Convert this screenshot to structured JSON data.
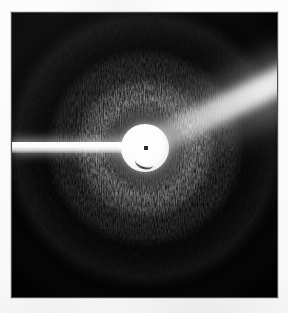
{
  "figure": {
    "title": "X-ray diffraction pattern",
    "kind": "fiber-diffraction-photograph"
  },
  "plate": {
    "label": "detector-image",
    "background_color": "#000000",
    "border_color": "#4a4a4a",
    "paper_color": "#fbfbfa",
    "left": 12,
    "top": 13,
    "width": 265,
    "height": 284
  },
  "beam_center": {
    "label": "beam-center",
    "x_percent": 50.2,
    "y_percent": 47.5,
    "marker_color": "#2c2c2c"
  },
  "beamstop": {
    "label": "beamstop-disc",
    "radius_px": 24,
    "color": "#ffffff"
  },
  "beam_arm": {
    "label": "beamstop-arm-streak",
    "direction": "left",
    "color": "#ffffff"
  },
  "wedge": {
    "label": "bright-scatter-wedge",
    "direction": "upper-right",
    "angle_deg": -26,
    "color": "#ffffff"
  },
  "chart_data": {
    "type": "heatmap",
    "title": "X-ray diffraction pattern",
    "subtitle": "",
    "xlabel": "",
    "ylabel": "",
    "colormap": "grayscale",
    "grid": false,
    "legend_position": "none",
    "annotations": [
      "beam center marker",
      "beamstop shadow arm (left)",
      "bright scatter wedge (upper right)"
    ],
    "radial_profile": {
      "description": "Azimuthally averaged intensity versus radius from the beam center, 0-255 grayscale.",
      "radius_px": [
        0,
        12,
        24,
        30,
        38,
        46,
        56,
        66,
        78,
        90,
        104,
        118,
        132,
        148,
        165,
        185,
        205
      ],
      "intensity": [
        255,
        255,
        250,
        190,
        120,
        96,
        150,
        178,
        168,
        126,
        92,
        104,
        118,
        86,
        42,
        18,
        6
      ]
    },
    "rings": [
      {
        "name": "beamstop halo",
        "radius_px": 26,
        "intensity": 252
      },
      {
        "name": "inner diffuse ring",
        "radius_px": 40,
        "intensity": 118
      },
      {
        "name": "first bright annulus",
        "radius_px": 68,
        "intensity": 180
      },
      {
        "name": "dark gap",
        "radius_px": 100,
        "intensity": 90
      },
      {
        "name": "second annulus",
        "radius_px": 126,
        "intensity": 120
      },
      {
        "name": "outer faint ring",
        "radius_px": 160,
        "intensity": 52
      },
      {
        "name": "vignette edge",
        "radius_px": 200,
        "intensity": 8
      }
    ],
    "azimuthal_features": [
      {
        "name": "beamstop arm",
        "angle_deg": 180,
        "width_deg": 6,
        "intensity": 255
      },
      {
        "name": "scatter wedge",
        "angle_deg": 26,
        "width_deg": 16,
        "intensity": 235
      }
    ]
  }
}
